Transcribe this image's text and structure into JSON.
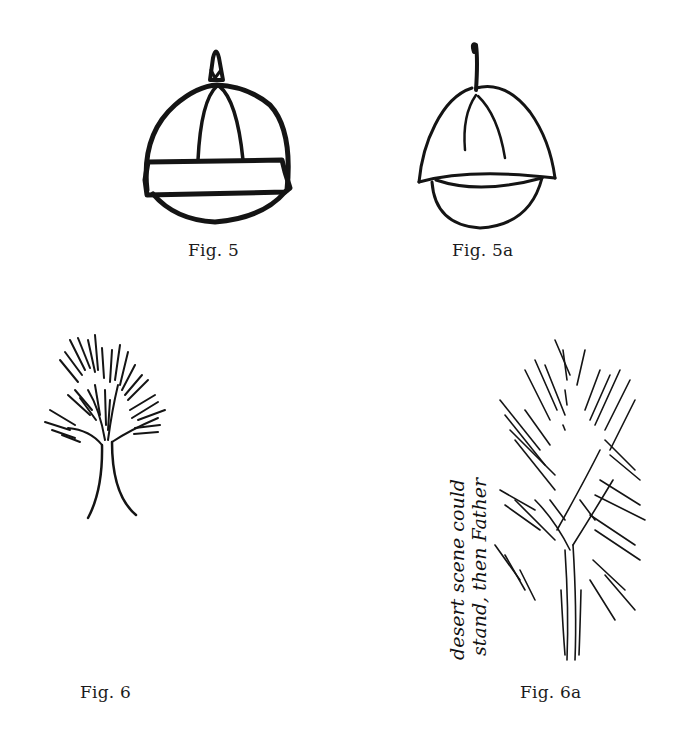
{
  "page": {
    "background": "#ffffff",
    "ink_color": "#141414"
  },
  "figures": [
    {
      "id": "fig5",
      "caption": "Fig. 5",
      "subject": "hat-drawing-with-band"
    },
    {
      "id": "fig5a",
      "caption": "Fig. 5a",
      "subject": "hat-drawing-without-band"
    },
    {
      "id": "fig6",
      "caption": "Fig. 6",
      "subject": "tree-drawing-small"
    },
    {
      "id": "fig6a",
      "caption": "Fig. 6a",
      "subject": "tree-drawing-sketchy",
      "annotation": {
        "line1": "desert scene could",
        "line2": "stand, then Father"
      }
    }
  ]
}
